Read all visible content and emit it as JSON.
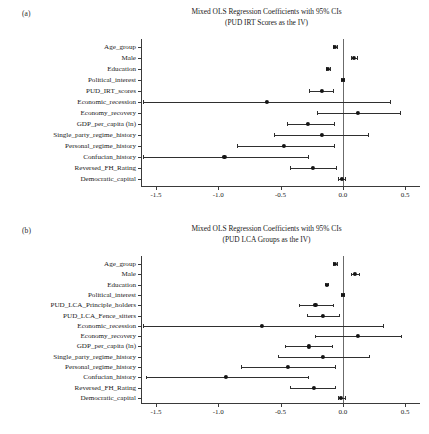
{
  "figure": {
    "panels": [
      {
        "tag": "(a)",
        "title_line1": "Mixed OLS Regression Coefficients with 95% CIs",
        "title_line2": "(PUD IRT Scores as the IV)"
      },
      {
        "tag": "(b)",
        "title_line1": "Mixed OLS Regression Coefficients with 95% CIs",
        "title_line2": "(PUD LCA Groups as the IV)"
      }
    ]
  },
  "chart_data": [
    {
      "type": "scatter",
      "subtype": "coefficient-plot",
      "panel": "(a)",
      "title": "Mixed OLS Regression Coefficients with 95% CIs (PUD IRT Scores as the IV)",
      "xlabel": "",
      "ylabel": "",
      "xlim": [
        -1.62,
        0.62
      ],
      "xticks": [
        -1.5,
        -1.0,
        -0.5,
        0.0,
        0.5
      ],
      "xtick_labels": [
        "-1.5",
        "-1.0",
        "-0.5",
        "0.0",
        "0.5"
      ],
      "grid": false,
      "legend": "none",
      "reference_line": 0.0,
      "categories": [
        "Age_group",
        "Male",
        "Education",
        "Political_interest",
        "PUD_IRT_scores",
        "Economic_recession",
        "Economy_recovery",
        "GDP_per_capita (ln)",
        "Single_party_regime_history",
        "Personal_regime_history",
        "Confucian_history",
        "Reversed_FH_Rating",
        "Democratic_capital"
      ],
      "values": [
        -0.06,
        0.09,
        -0.12,
        0.0,
        -0.17,
        -0.61,
        0.12,
        -0.28,
        -0.17,
        -0.47,
        -0.95,
        -0.24,
        -0.01
      ],
      "ci_low": [
        -0.075,
        0.065,
        -0.135,
        -0.012,
        -0.27,
        -1.6,
        -0.21,
        -0.45,
        -0.55,
        -0.85,
        -1.6,
        -0.42,
        -0.035
      ],
      "ci_high": [
        -0.045,
        0.115,
        -0.105,
        0.012,
        -0.075,
        0.38,
        0.46,
        -0.07,
        0.2,
        -0.07,
        -0.28,
        -0.055,
        0.02
      ]
    },
    {
      "type": "scatter",
      "subtype": "coefficient-plot",
      "panel": "(b)",
      "title": "Mixed OLS Regression Coefficients with 95% CIs (PUD LCA Groups as the IV)",
      "xlabel": "",
      "ylabel": "",
      "xlim": [
        -1.62,
        0.62
      ],
      "xticks": [
        -1.5,
        -1.0,
        -0.5,
        0.0,
        0.5
      ],
      "xtick_labels": [
        "-1.5",
        "-1.0",
        "-0.5",
        "0.0",
        "0.5"
      ],
      "grid": false,
      "legend": "none",
      "reference_line": 0.0,
      "categories": [
        "Age_group",
        "Male",
        "Education",
        "Political_interest",
        "PUD_LCA_Principle_holders",
        "PUD_LCA_Fence_sitters",
        "Economic_recession",
        "Economy_recovery",
        "GDP_per_capita (ln)",
        "Single_party_regime_history",
        "Personal_regime_history",
        "Confucian_history",
        "Reversed_FH_Rating",
        "Democratic_capital"
      ],
      "values": [
        -0.06,
        0.1,
        -0.13,
        0.0,
        -0.22,
        -0.16,
        -0.65,
        0.12,
        -0.27,
        -0.16,
        -0.44,
        -0.94,
        -0.23,
        -0.015
      ],
      "ci_low": [
        -0.075,
        0.07,
        -0.145,
        -0.012,
        -0.35,
        -0.29,
        -1.6,
        -0.22,
        -0.46,
        -0.52,
        -0.82,
        -1.58,
        -0.42,
        -0.04
      ],
      "ci_high": [
        -0.045,
        0.13,
        -0.115,
        0.012,
        -0.08,
        -0.03,
        0.32,
        0.47,
        -0.09,
        0.21,
        -0.06,
        -0.28,
        -0.06,
        0.015
      ]
    }
  ],
  "colors": {
    "point": "#141414",
    "ci": "#2f2f2f",
    "axis": "#3a3a3a",
    "zero_line": "#6b6b6b",
    "background": "#ffffff"
  }
}
